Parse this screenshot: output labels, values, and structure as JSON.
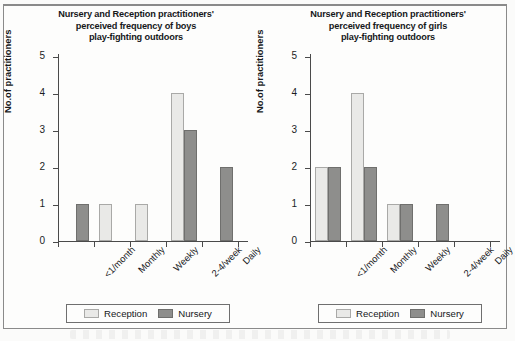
{
  "legend": {
    "items": [
      {
        "label": "Reception",
        "swatch": "reception",
        "color": "#e9e9e7"
      },
      {
        "label": "Nursery",
        "swatch": "nursery",
        "color": "#8e8e8c"
      }
    ]
  },
  "axis": {
    "y_label": "No.of practitioners",
    "y_ticks": [
      "0",
      "1",
      "2",
      "3",
      "4",
      "5"
    ],
    "x_categories": [
      "<1/month",
      "Monthly",
      "Weekly",
      "2-4/week",
      "Daily"
    ]
  },
  "chart_data": [
    {
      "type": "bar",
      "title": "Nursery and Reception practitioners' perceived frequency of boys play-fighting outdoors",
      "title_lines": [
        "Nursery and Reception practitioners'",
        "perceived frequency of boys",
        "play-fighting outdoors"
      ],
      "categories": [
        "<1/month",
        "Monthly",
        "Weekly",
        "2-4/week",
        "Daily"
      ],
      "series": [
        {
          "name": "Reception",
          "color": "#e9e9e7",
          "values": [
            0,
            1,
            1,
            4,
            0
          ]
        },
        {
          "name": "Nursery",
          "color": "#8e8e8c",
          "values": [
            1,
            0,
            0,
            3,
            2
          ]
        }
      ],
      "xlabel": "",
      "ylabel": "No.of practitioners",
      "ylim": [
        0,
        5
      ],
      "ytick_step": 1,
      "grid": false,
      "legend_position": "bottom"
    },
    {
      "type": "bar",
      "title": "Nursery and Reception practitioners' perceived frequency of girls play-fighting outdoors",
      "title_lines": [
        "Nursery and Reception practitioners'",
        "perceived frequency of girls",
        "play-fighting outdoors"
      ],
      "categories": [
        "<1/month",
        "Monthly",
        "Weekly",
        "2-4/week",
        "Daily"
      ],
      "series": [
        {
          "name": "Reception",
          "color": "#e9e9e7",
          "values": [
            2,
            4,
            1,
            0,
            0
          ]
        },
        {
          "name": "Nursery",
          "color": "#8e8e8c",
          "values": [
            2,
            2,
            1,
            1,
            0
          ]
        }
      ],
      "xlabel": "",
      "ylabel": "No.of practitioners",
      "ylim": [
        0,
        5
      ],
      "ytick_step": 1,
      "grid": false,
      "legend_position": "bottom"
    }
  ]
}
